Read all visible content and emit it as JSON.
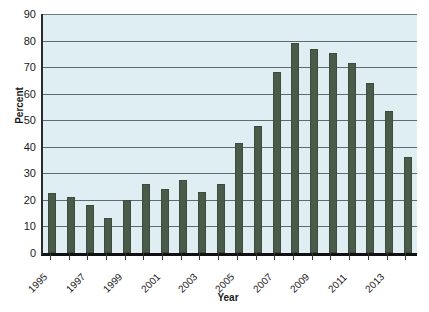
{
  "chart_data": {
    "type": "bar",
    "title": "",
    "xlabel": "Year",
    "ylabel": "Percent",
    "categories": [
      "1995",
      "1996",
      "1997",
      "1998",
      "1999",
      "2000",
      "2001",
      "2002",
      "2003",
      "2004",
      "2005",
      "2006",
      "2007",
      "2008",
      "2009",
      "2010",
      "2011",
      "2012",
      "2013",
      "2014"
    ],
    "values": [
      22.5,
      21,
      18,
      13,
      20,
      26,
      24,
      27.5,
      23,
      26,
      41.5,
      48,
      68,
      79,
      77,
      75.5,
      71.5,
      64,
      53.5,
      36
    ],
    "tick_labels_shown": [
      "1995",
      "",
      "1997",
      "",
      "1999",
      "",
      "2001",
      "",
      "2003",
      "",
      "2005",
      "",
      "2007",
      "",
      "2009",
      "",
      "2011",
      "",
      "2013",
      ""
    ],
    "ylim": [
      0,
      90
    ],
    "yticks": [
      0,
      10,
      20,
      30,
      40,
      50,
      60,
      70,
      80,
      90
    ],
    "grid": true,
    "legend": "none",
    "bar_color": "#4a5b4a",
    "plot_background": "#dfeef2",
    "gridline_color": "#5b6b6e"
  }
}
